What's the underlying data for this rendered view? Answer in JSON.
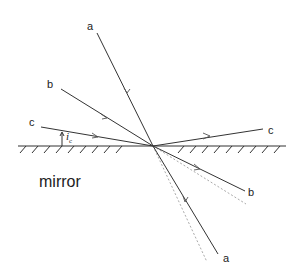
{
  "diagram": {
    "mirror_label": "mirror",
    "angle_label": "i",
    "angle_subscript": "c",
    "rays": [
      {
        "id": "a",
        "incident_label": "a",
        "outgoing_label": "a"
      },
      {
        "id": "b",
        "incident_label": "b",
        "outgoing_label": "b"
      },
      {
        "id": "c",
        "incident_label": "c",
        "outgoing_label": "c"
      }
    ],
    "colors": {
      "line": "#333333",
      "dotted": "#aaaaaa",
      "background": "#ffffff"
    }
  }
}
